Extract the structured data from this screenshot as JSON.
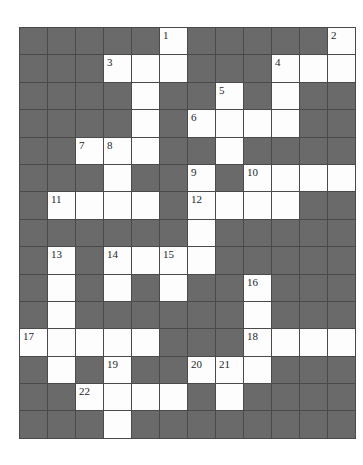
{
  "page": {
    "background_color": "#ffffff"
  },
  "puzzle": {
    "kind": "crossword-grid",
    "cols": 12,
    "rows": 15,
    "colors": {
      "white_cell": "#fdfdfd",
      "dark_cell": "#6a6a6a",
      "grid_line": "#4a4a4a",
      "number_text": "#1f1f1f"
    },
    "pattern": [
      "#####O#####O",
      "###OOO###OOO",
      "####O##O#O##",
      "####O#OOOO##",
      "##OOO##O####",
      "###O##O#OOOO",
      "#OOOO#OOOO##",
      "######O#####",
      "#O#OOOO#####",
      "#O#O#O##O###",
      "#O######O###",
      "OOOOO###OOOO",
      "#O#O##OOO###",
      "##OOOO#O####",
      "###O########"
    ],
    "numbers": [
      {
        "num": "1",
        "row": 0,
        "col": 5
      },
      {
        "num": "2",
        "row": 0,
        "col": 11
      },
      {
        "num": "3",
        "row": 1,
        "col": 3
      },
      {
        "num": "4",
        "row": 1,
        "col": 9
      },
      {
        "num": "5",
        "row": 2,
        "col": 7
      },
      {
        "num": "6",
        "row": 3,
        "col": 6
      },
      {
        "num": "7",
        "row": 4,
        "col": 2
      },
      {
        "num": "8",
        "row": 4,
        "col": 3
      },
      {
        "num": "9",
        "row": 5,
        "col": 6
      },
      {
        "num": "10",
        "row": 5,
        "col": 8
      },
      {
        "num": "11",
        "row": 6,
        "col": 1
      },
      {
        "num": "12",
        "row": 6,
        "col": 6
      },
      {
        "num": "13",
        "row": 8,
        "col": 1
      },
      {
        "num": "14",
        "row": 8,
        "col": 3
      },
      {
        "num": "15",
        "row": 8,
        "col": 5
      },
      {
        "num": "16",
        "row": 9,
        "col": 8
      },
      {
        "num": "17",
        "row": 11,
        "col": 0
      },
      {
        "num": "18",
        "row": 11,
        "col": 8
      },
      {
        "num": "19",
        "row": 12,
        "col": 3
      },
      {
        "num": "20",
        "row": 12,
        "col": 6
      },
      {
        "num": "21",
        "row": 12,
        "col": 7
      },
      {
        "num": "22",
        "row": 13,
        "col": 2
      }
    ]
  }
}
